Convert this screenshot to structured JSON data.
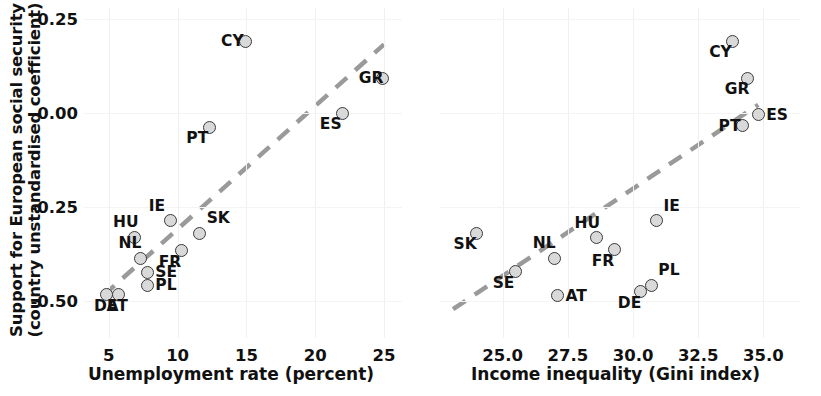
{
  "figure": {
    "ylabel_line1": "Support for European social security",
    "ylabel_line2": "(country unstandardised coefficient)",
    "marker_fill": "#d9d9d9",
    "marker_edge": "#3a3a3a",
    "trend_color": "#9a9a9a",
    "grid_color": "#f0f0f0"
  },
  "chart_data": [
    {
      "type": "scatter",
      "panel": "left",
      "title": "",
      "xlabel": "Unemployment rate (percent)",
      "ylabel": "Support for European social security (country unstandardised coefficient)",
      "xlim": [
        3.2,
        26.3
      ],
      "ylim": [
        -0.6,
        0.28
      ],
      "xticks": [
        5,
        10,
        15,
        20,
        25
      ],
      "xticklabels": [
        "5",
        "10",
        "15",
        "20",
        "25"
      ],
      "yticks": [
        0.25,
        0.0,
        -0.25,
        -0.5
      ],
      "yticklabels": [
        "0.25",
        "0.00",
        "-0.25",
        "-0.50"
      ],
      "grid": true,
      "legend": "none",
      "trendline": {
        "style": "dashed",
        "x0": 4.6,
        "y0": -0.487,
        "x1": 25.0,
        "y1": 0.183
      },
      "points": [
        {
          "label": "CY",
          "x": 14.9,
          "y": 0.191,
          "label_pos": "left"
        },
        {
          "label": "GR",
          "x": 24.9,
          "y": 0.093,
          "label_pos": "left"
        },
        {
          "label": "ES",
          "x": 22.0,
          "y": 0.0,
          "label_pos": "below-left"
        },
        {
          "label": "PT",
          "x": 12.3,
          "y": -0.038,
          "label_pos": "below-left"
        },
        {
          "label": "IE",
          "x": 9.5,
          "y": -0.287,
          "label_pos": "above-left"
        },
        {
          "label": "SK",
          "x": 11.6,
          "y": -0.32,
          "label_pos": "above-right"
        },
        {
          "label": "HU",
          "x": 6.9,
          "y": -0.331,
          "label_pos": "above-left"
        },
        {
          "label": "FR",
          "x": 10.3,
          "y": -0.367,
          "label_pos": "below-left"
        },
        {
          "label": "NL",
          "x": 7.3,
          "y": -0.387,
          "label_pos": "above-left"
        },
        {
          "label": "SE",
          "x": 7.8,
          "y": -0.425,
          "label_pos": "right"
        },
        {
          "label": "PL",
          "x": 7.8,
          "y": -0.459,
          "label_pos": "right"
        },
        {
          "label": "DE",
          "x": 4.8,
          "y": -0.485,
          "label_pos": "below"
        },
        {
          "label": "AT",
          "x": 5.7,
          "y": -0.485,
          "label_pos": "below"
        }
      ]
    },
    {
      "type": "scatter",
      "panel": "right",
      "title": "",
      "xlabel": "Income inequality (Gini index)",
      "ylabel": "Support for European social security (country unstandardised coefficient)",
      "xlim": [
        22.6,
        36.4
      ],
      "ylim": [
        -0.6,
        0.28
      ],
      "xticks": [
        25.0,
        27.5,
        30.0,
        32.5,
        35.0
      ],
      "xticklabels": [
        "25.0",
        "27.5",
        "30.0",
        "32.5",
        "35.0"
      ],
      "yticks": [
        0.25,
        0.0,
        -0.25,
        -0.5
      ],
      "yticklabels": [
        "0.25",
        "0.00",
        "-0.25",
        "-0.50"
      ],
      "grid": true,
      "legend": "none",
      "trendline": {
        "style": "dashed",
        "x0": 23.1,
        "y0": -0.523,
        "x1": 34.8,
        "y1": 0.022
      },
      "points": [
        {
          "label": "CY",
          "x": 33.8,
          "y": 0.191,
          "label_pos": "below-left"
        },
        {
          "label": "GR",
          "x": 34.4,
          "y": 0.093,
          "label_pos": "below-left"
        },
        {
          "label": "ES",
          "x": 34.8,
          "y": -0.004,
          "label_pos": "right"
        },
        {
          "label": "PT",
          "x": 34.2,
          "y": -0.034,
          "label_pos": "left"
        },
        {
          "label": "IE",
          "x": 30.9,
          "y": -0.287,
          "label_pos": "above-right"
        },
        {
          "label": "SK",
          "x": 24.0,
          "y": -0.32,
          "label_pos": "below-left"
        },
        {
          "label": "HU",
          "x": 28.6,
          "y": -0.332,
          "label_pos": "above-left"
        },
        {
          "label": "FR",
          "x": 29.3,
          "y": -0.365,
          "label_pos": "below-left"
        },
        {
          "label": "NL",
          "x": 27.0,
          "y": -0.387,
          "label_pos": "above-left"
        },
        {
          "label": "SE",
          "x": 25.5,
          "y": -0.423,
          "label_pos": "below-left"
        },
        {
          "label": "PL",
          "x": 30.7,
          "y": -0.459,
          "label_pos": "above-right"
        },
        {
          "label": "DE",
          "x": 30.3,
          "y": -0.476,
          "label_pos": "below-left"
        },
        {
          "label": "AT",
          "x": 27.1,
          "y": -0.487,
          "label_pos": "right"
        }
      ]
    }
  ]
}
